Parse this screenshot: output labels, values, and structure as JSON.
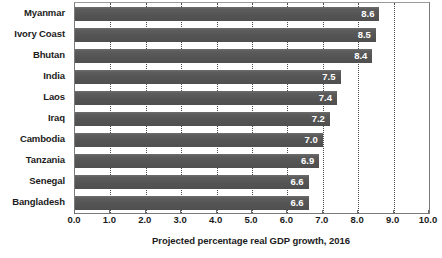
{
  "chart_data": {
    "type": "bar",
    "orientation": "horizontal",
    "title": "",
    "subtitle": "",
    "xlabel": "Projected percentage real GDP growth, 2016",
    "ylabel": "",
    "xlim": [
      0.0,
      10.0
    ],
    "xticks": [
      "0.0",
      "1.0",
      "2.0",
      "3.0",
      "4.0",
      "5.0",
      "6.0",
      "7.0",
      "8.0",
      "9.0",
      "10.0"
    ],
    "grid": "vertical-dotted",
    "legend": null,
    "bar_color": "#595959",
    "value_label_color": "#ffffff",
    "categories": [
      "Myanmar",
      "Ivory Coast",
      "Bhutan",
      "India",
      "Laos",
      "Iraq",
      "Cambodia",
      "Tanzania",
      "Senegal",
      "Bangladesh"
    ],
    "values": [
      8.6,
      8.5,
      8.4,
      7.5,
      7.4,
      7.2,
      7.0,
      6.9,
      6.6,
      6.6
    ],
    "value_labels": [
      "8.6",
      "8.5",
      "8.4",
      "7.5",
      "7.4",
      "7.2",
      "7.0",
      "6.9",
      "6.6",
      "6.6"
    ]
  }
}
